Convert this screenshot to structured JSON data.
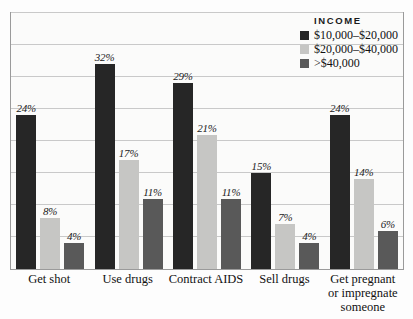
{
  "chart_data": {
    "type": "bar",
    "title": "",
    "xlabel": "",
    "ylabel": "",
    "ylim": [
      0,
      40
    ],
    "grid": true,
    "gridlines": [
      5,
      10,
      15,
      20,
      25,
      30,
      35,
      40
    ],
    "legend_position": "top-right",
    "legend_title": "INCOME",
    "categories": [
      "Get shot",
      "Use drugs",
      "Contract AIDS",
      "Sell drugs",
      "Get pregnant\nor impregnate\nsomeone"
    ],
    "series": [
      {
        "name": "$10,000–$20,000",
        "color": "#262626",
        "values": [
          24,
          32,
          29,
          15,
          24
        ],
        "labels": [
          "24%",
          "32%",
          "29%",
          "15%",
          "24%"
        ]
      },
      {
        "name": "$20,000–$40,000",
        "color": "#c6c6c4",
        "values": [
          8,
          17,
          21,
          7,
          14
        ],
        "labels": [
          "8%",
          "17%",
          "21%",
          "7%",
          "14%"
        ]
      },
      {
        "name": ">$40,000",
        "color": "#595959",
        "values": [
          4,
          11,
          11,
          4,
          6
        ],
        "labels": [
          "4%",
          "11%",
          "11%",
          "4%",
          "6%"
        ]
      }
    ]
  },
  "categories_display": [
    {
      "line1": "Get shot",
      "line2": "",
      "line3": ""
    },
    {
      "line1": "Use drugs",
      "line2": "",
      "line3": ""
    },
    {
      "line1": "Contract AIDS",
      "line2": "",
      "line3": ""
    },
    {
      "line1": "Sell drugs",
      "line2": "",
      "line3": ""
    },
    {
      "line1": "Get pregnant",
      "line2": "or impregnate",
      "line3": "someone"
    }
  ],
  "legend": {
    "title": "INCOME",
    "items": [
      {
        "label": "$10,000–$20,000",
        "color": "#262626"
      },
      {
        "label": "$20,000–$40,000",
        "color": "#c6c6c4"
      },
      {
        "label": ">$40,000",
        "color": "#595959"
      }
    ]
  },
  "colors": {
    "plot_background": "#fbfbfa",
    "page_background": "#fdfdfd",
    "frame": "#9a9a9a",
    "gridline": "#c9c9c9",
    "text": "#111111"
  }
}
